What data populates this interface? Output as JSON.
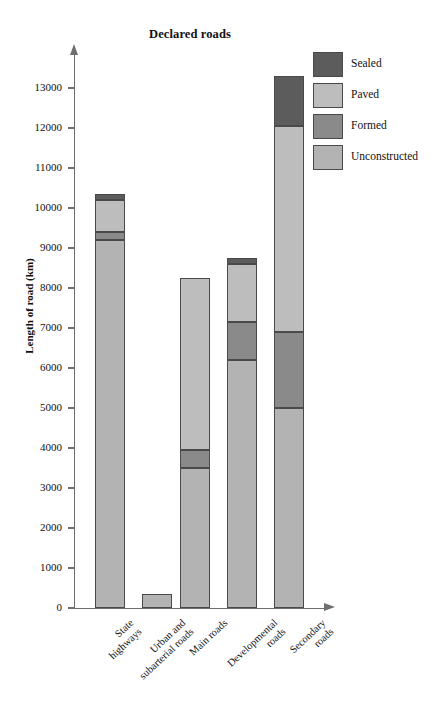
{
  "chart_data": {
    "type": "bar",
    "title": "Declared roads",
    "xlabel": "",
    "ylabel": "Length of road (km)",
    "ylim": [
      0,
      13600
    ],
    "grid": false,
    "stacked": true,
    "legend_position": "top-right",
    "categories": [
      "State\nhighways",
      "Urban and\nsubarterial roads",
      "Main roads",
      "Developmental\nroads",
      "Secondary\nroads"
    ],
    "yticks": [
      0,
      1000,
      2000,
      3000,
      4000,
      5000,
      6000,
      7000,
      8000,
      9000,
      10000,
      11000,
      12000,
      13000
    ],
    "ytick_labels": [
      "0",
      "1000",
      "2000",
      "3000",
      "4000",
      "5000",
      "6000",
      "7000",
      "8000",
      "9000",
      "10000",
      "11000",
      "12000",
      "13000"
    ],
    "series": [
      {
        "name": "Unconstructed",
        "color": "#b3b3b3",
        "values": [
          9200,
          350,
          3500,
          6200,
          5000
        ]
      },
      {
        "name": "Formed",
        "color": "#8a8a8a",
        "values": [
          200,
          0,
          450,
          950,
          1900
        ]
      },
      {
        "name": "Paved",
        "color": "#bdbdbd",
        "values": [
          800,
          0,
          4300,
          1450,
          5150
        ]
      },
      {
        "name": "Sealed",
        "color": "#5c5c5c",
        "values": [
          150,
          0,
          0,
          150,
          1250
        ]
      }
    ],
    "totals": [
      10350,
      350,
      8250,
      8750,
      13300
    ]
  },
  "legend": {
    "items": [
      {
        "label": "Sealed",
        "color": "#5c5c5c"
      },
      {
        "label": "Paved",
        "color": "#bdbdbd"
      },
      {
        "label": "Formed",
        "color": "#8a8a8a"
      },
      {
        "label": "Unconstructed",
        "color": "#b3b3b3"
      }
    ]
  },
  "axis": {
    "arrow_up": "axis-arrow-up",
    "arrow_right": "axis-arrow-right"
  }
}
